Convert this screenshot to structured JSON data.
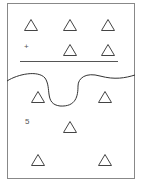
{
  "diagram": {
    "frame": {
      "x": 7,
      "y": 3,
      "w": 128,
      "h": 176,
      "stroke": "#888888"
    },
    "divider_line": {
      "x1": 20,
      "y1": 61,
      "x2": 118,
      "y2": 61,
      "stroke": "#555555"
    },
    "tear_curve_color": "#333333",
    "triangle_color": "#444444",
    "triangles": [
      {
        "cx": 31,
        "cy": 25
      },
      {
        "cx": 70,
        "cy": 25
      },
      {
        "cx": 108,
        "cy": 25
      },
      {
        "cx": 70,
        "cy": 50
      },
      {
        "cx": 108,
        "cy": 50
      },
      {
        "cx": 38,
        "cy": 97
      },
      {
        "cx": 105,
        "cy": 97
      },
      {
        "cx": 70,
        "cy": 127
      },
      {
        "cx": 38,
        "cy": 160
      },
      {
        "cx": 105,
        "cy": 160
      }
    ],
    "labels": {
      "plus": "+",
      "five": "5"
    }
  }
}
